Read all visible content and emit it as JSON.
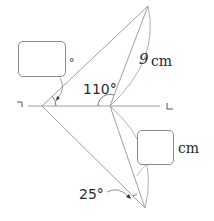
{
  "diagram": {
    "type": "geometry-folding-figure",
    "labels": {
      "angle_top": "110°",
      "side_length": "9",
      "side_unit": "cm",
      "angle_bottom": "25°",
      "box_top_unit": "°",
      "box_right_unit": "cm",
      "left_marker": "¬",
      "right_marker": "L"
    },
    "answer_boxes": [
      {
        "id": "unknown-angle",
        "unit": "°",
        "value": ""
      },
      {
        "id": "unknown-length",
        "unit": "cm",
        "value": ""
      }
    ],
    "colors": {
      "line": "#9a9a9a",
      "text": "#2a2a2a",
      "box_border": "#8a8a8a"
    }
  }
}
